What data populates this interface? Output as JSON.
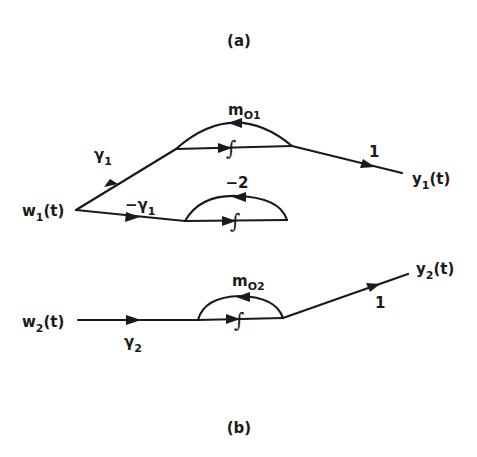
{
  "figure": {
    "caption_a": "(a)",
    "caption_b": "(b)",
    "colors": {
      "ink": "#1a1a1a",
      "background": "#ffffff"
    }
  },
  "diagram_a": {
    "input": {
      "name": "w",
      "sub": "1",
      "arg": "(t)"
    },
    "output": {
      "name": "y",
      "sub": "1",
      "arg": "(t)"
    },
    "upper_branch_gain": {
      "name": "γ",
      "sub": "1"
    },
    "lower_branch_gain": {
      "name": "−γ",
      "sub": "1"
    },
    "upper_feedback_gain": {
      "name": "m",
      "sub": "O1"
    },
    "lower_feedback_gain": "−2",
    "integrator_symbol": "∫",
    "output_gain": "1"
  },
  "diagram_b": {
    "input": {
      "name": "w",
      "sub": "2",
      "arg": "(t)"
    },
    "output": {
      "name": "y",
      "sub": "2",
      "arg": "(t)"
    },
    "input_gain": {
      "name": "γ",
      "sub": "2"
    },
    "feedback_gain": {
      "name": "m",
      "sub": "O2"
    },
    "integrator_symbol": "∫",
    "output_gain": "1"
  }
}
